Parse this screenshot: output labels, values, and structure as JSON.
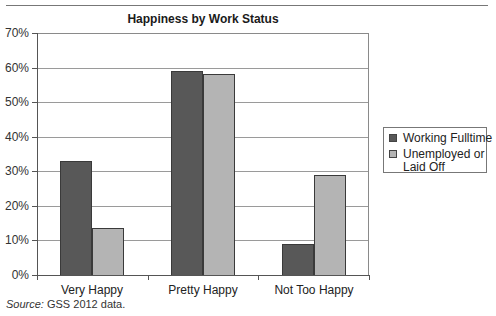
{
  "header": {
    "rule": true
  },
  "chart_data": {
    "type": "bar",
    "title": "Happiness by Work Status",
    "categories": [
      "Very Happy",
      "Pretty Happy",
      "Not Too Happy"
    ],
    "series": [
      {
        "name": "Working Fulltime",
        "color": "#585858",
        "values": [
          33,
          59,
          9
        ]
      },
      {
        "name": "Unemployed or Laid Off",
        "color": "#b4b4b4",
        "values": [
          13.5,
          58,
          29
        ]
      }
    ],
    "xlabel": "",
    "ylabel": "",
    "ylim": [
      0,
      70
    ],
    "yticks": [
      "0%",
      "10%",
      "20%",
      "30%",
      "40%",
      "50%",
      "60%",
      "70%"
    ],
    "grid": true,
    "legend_position": "right"
  },
  "legend": {
    "items": [
      {
        "label_line1": "Working Fulltime",
        "label_line2": ""
      },
      {
        "label_line1": "Unemployed or",
        "label_line2": "Laid Off"
      }
    ]
  },
  "source": {
    "prefix": "Source:",
    "text": " GSS 2012 data."
  }
}
